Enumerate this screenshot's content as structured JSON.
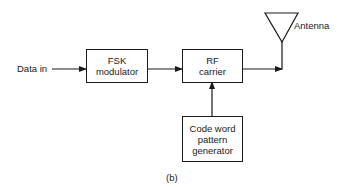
{
  "diagram": {
    "input_label": "Data in",
    "blocks": [
      {
        "id": "fsk",
        "lines": [
          "FSK",
          "modulator"
        ]
      },
      {
        "id": "rf",
        "lines": [
          "RF",
          "carrier"
        ]
      },
      {
        "id": "code",
        "lines": [
          "Code word",
          "pattern",
          "generator"
        ]
      }
    ],
    "antenna_label": "Antenna",
    "caption": "(b)",
    "connections": [
      {
        "from": "Data in",
        "to": "FSK modulator"
      },
      {
        "from": "FSK modulator",
        "to": "RF carrier"
      },
      {
        "from": "Code word pattern generator",
        "to": "RF carrier"
      },
      {
        "from": "RF carrier",
        "to": "Antenna"
      }
    ]
  }
}
